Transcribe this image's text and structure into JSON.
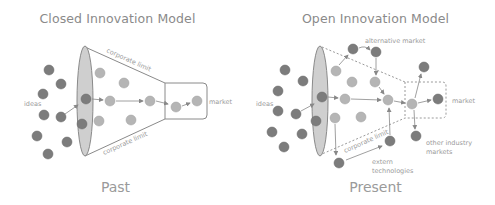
{
  "closed": {
    "title": "Closed Innovation Model",
    "caption": "Past",
    "labels": {
      "ideas": "ideas",
      "corporate_limit_top": "corporate limit",
      "corporate_limit_bottom": "corporate limit",
      "market": "market"
    }
  },
  "open": {
    "title": "Open Innovation Model",
    "caption": "Present",
    "labels": {
      "ideas": "ideas",
      "alternative_market": "alternative market",
      "corporate_limit": "corporate limit",
      "market": "market",
      "other_industry_markets_1": "other industry",
      "other_industry_markets_2": "markets",
      "extern_technologies_1": "extern",
      "extern_technologies_2": "technologies"
    }
  },
  "colors": {
    "dark_circle": "#7c7c7c",
    "mid_circle": "#9b9b9b",
    "light_circle": "#c4c4c4",
    "funnel_ellipse": "#c9c9c9",
    "line": "#8a8a8a",
    "text": "#9a9a9a"
  }
}
